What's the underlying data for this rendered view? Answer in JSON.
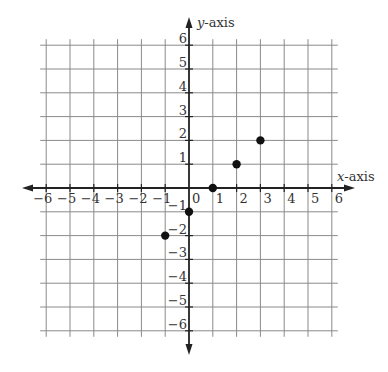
{
  "chart_data": {
    "type": "scatter",
    "title": "",
    "xlabel": "x-axis",
    "ylabel": "y-axis",
    "xlim": [
      -6,
      6
    ],
    "ylim": [
      -6,
      6
    ],
    "grid": true,
    "x_ticks": [
      -6,
      -5,
      -4,
      -3,
      -2,
      -1,
      0,
      1,
      2,
      3,
      4,
      5,
      6
    ],
    "y_ticks": [
      -6,
      -5,
      -4,
      -3,
      -2,
      -1,
      1,
      2,
      3,
      4,
      5,
      6
    ],
    "x_tick_labels": [
      "−6",
      "−5",
      "−4",
      "−3",
      "−2",
      "−1",
      "0",
      "1",
      "2",
      "3",
      "4",
      "5",
      "6"
    ],
    "y_tick_labels": [
      "−6",
      "−5",
      "−4",
      "−3",
      "−2",
      "−1",
      "1",
      "2",
      "3",
      "4",
      "5",
      "6"
    ],
    "series": [
      {
        "name": "points",
        "x": [
          -1,
          0,
          1,
          2,
          3
        ],
        "y": [
          -2,
          -1,
          0,
          1,
          2
        ]
      }
    ],
    "point_color": "#111111",
    "grid_color": "#8a8a8a",
    "axis_color": "#222222"
  }
}
